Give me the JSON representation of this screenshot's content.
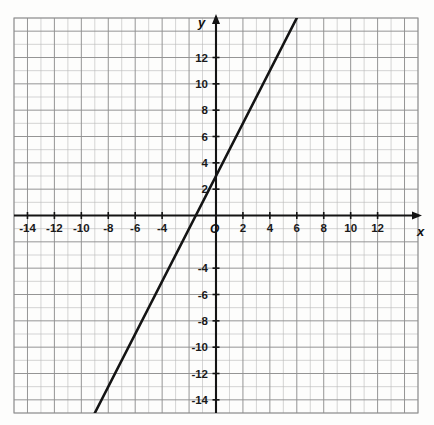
{
  "chart_data": {
    "type": "line",
    "title": "",
    "subtitle": "",
    "xlabel": "x",
    "ylabel": "y",
    "origin_label": "O",
    "xlim": [
      -15,
      15
    ],
    "ylim": [
      -15,
      15
    ],
    "grid": true,
    "grid_step": 1,
    "tick_step": 2,
    "legend": "none",
    "x_tick_labels": [
      "-14",
      "-12",
      "-10",
      "-8",
      "-6",
      "-4",
      "2",
      "4",
      "6",
      "8",
      "10",
      "12"
    ],
    "x_tick_values": [
      -14,
      -12,
      -10,
      -8,
      -6,
      -4,
      2,
      4,
      6,
      8,
      10,
      12
    ],
    "y_tick_labels": [
      "12",
      "10",
      "8",
      "6",
      "4",
      "2",
      "-4",
      "-6",
      "-8",
      "-10",
      "-12",
      "-14"
    ],
    "y_tick_values": [
      12,
      10,
      8,
      6,
      4,
      2,
      -4,
      -6,
      -8,
      -10,
      -12,
      -14
    ],
    "series": [
      {
        "name": "line",
        "equation": "y = 2x + 3",
        "slope": 2,
        "intercept": 3,
        "x_intercept": -1.5,
        "points": [
          [
            -8.8,
            -14.6
          ],
          [
            -1.5,
            0
          ],
          [
            0,
            3
          ],
          [
            5,
            13
          ],
          [
            5.8,
            14.6
          ]
        ],
        "color": "#141414",
        "width": 2.6
      }
    ],
    "colors": {
      "axis": "#141414",
      "grid_minor": "#b8b8b8",
      "grid_major": "#8f8f8f",
      "line": "#141414",
      "background": "#fdfdfc",
      "text": "#1a1a1a"
    }
  }
}
